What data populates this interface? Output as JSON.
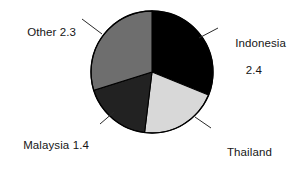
{
  "chart_data": {
    "type": "pie",
    "title": "",
    "subtitle": "",
    "xlabel": "",
    "ylabel": "",
    "legend_position": "none",
    "labels_position": "outside-with-leader-lines",
    "grid": false,
    "total": 7.7,
    "units": "",
    "categories": [
      "Indonesia",
      "Thailand",
      "Malaysia",
      "Other"
    ],
    "values": [
      2.4,
      1.6,
      1.4,
      2.3
    ],
    "slices": [
      {
        "name": "Indonesia",
        "value": 2.4,
        "value_text": "2.4",
        "label_text": "Indonesia",
        "color": "#000000",
        "start_angle": 0,
        "end_angle": 112.2,
        "percent": 31.2
      },
      {
        "name": "Thailand",
        "value": 1.6,
        "value_text": "1.6",
        "label_text": "Thailand",
        "color": "#d8d8d8",
        "start_angle": 112.2,
        "end_angle": 187.0,
        "percent": 20.8
      },
      {
        "name": "Malaysia",
        "value": 1.4,
        "value_text": "1.4",
        "label_text": "Malaysia",
        "color": "#222222",
        "start_angle": 187.0,
        "end_angle": 252.5,
        "percent": 18.2
      },
      {
        "name": "Other",
        "value": 2.3,
        "value_text": "2.3",
        "label_text": "Other",
        "color": "#6e6e6e",
        "start_angle": 252.5,
        "end_angle": 360,
        "percent": 29.9
      }
    ]
  },
  "labels": {
    "other": "Other 2.3",
    "indonesia_line1": "Indonesia",
    "indonesia_line2": "2.4",
    "malaysia": "Malaysia 1.4",
    "thailand_line1": "Thailand",
    "thailand_line2": "1.6"
  },
  "style": {
    "background": "#ffffff",
    "outline": "#000000",
    "leader_line": "#2a2a2a",
    "text": "#161616"
  }
}
